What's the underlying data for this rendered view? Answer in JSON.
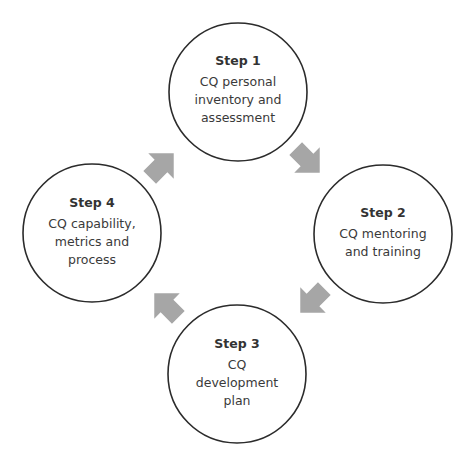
{
  "diagram": {
    "type": "cycle",
    "colors": {
      "circle_stroke": "#2b2b2b",
      "circle_fill": "#ffffff",
      "arrow_fill": "#a6a6a6",
      "text": "#3a3a3a"
    },
    "steps": [
      {
        "title": "Step 1",
        "description": "CQ personal\ninventory and\nassessment"
      },
      {
        "title": "Step 2",
        "description": "CQ mentoring\nand training"
      },
      {
        "title": "Step 3",
        "description": "CQ\ndevelopment\nplan"
      },
      {
        "title": "Step 4",
        "description": "CQ capability,\nmetrics and\nprocess"
      }
    ],
    "arrows": [
      {
        "from": "Step 1",
        "to": "Step 2",
        "direction": "down-right"
      },
      {
        "from": "Step 2",
        "to": "Step 3",
        "direction": "down-left"
      },
      {
        "from": "Step 3",
        "to": "Step 4",
        "direction": "up-left"
      },
      {
        "from": "Step 4",
        "to": "Step 1",
        "direction": "up-right"
      }
    ]
  }
}
